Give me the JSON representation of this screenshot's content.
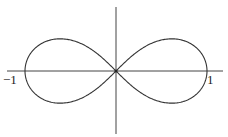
{
  "figure": {
    "equation": "(x^2 + y^2)^2 = x^2 - y^2",
    "left_label": "−1",
    "right_label": "1",
    "colors": {
      "stroke": "#333333",
      "background": "#ffffff"
    }
  },
  "chart_data": {
    "type": "line",
    "title": "",
    "xlabel": "",
    "ylabel": "",
    "tick_labels": [
      "−1",
      "1"
    ],
    "xlim": [
      -1.25,
      1.25
    ],
    "curve": "lemniscate",
    "x_intercepts": [
      -1,
      0,
      1
    ],
    "max_y": 0.3536,
    "grid": false,
    "legend": null
  }
}
